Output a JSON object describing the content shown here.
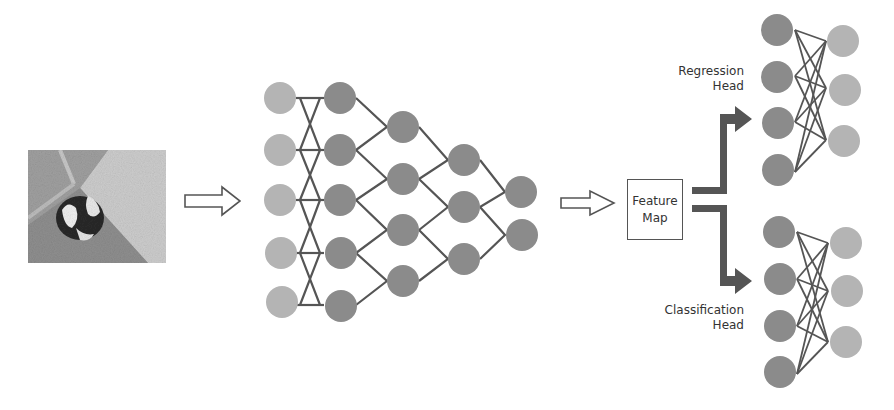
{
  "diagram": {
    "title": "",
    "input_image": {
      "description": "grayscale photo of a black-and-white dog/cat lying on floor near wall corner"
    },
    "stages": [
      {
        "id": "input",
        "label": ""
      },
      {
        "id": "backbone",
        "label": ""
      },
      {
        "id": "feature_map",
        "label": "Feature Map"
      },
      {
        "id": "regression_head",
        "label": "Regression Head"
      },
      {
        "id": "classification_head",
        "label": "Classification Head"
      }
    ],
    "feature_map": {
      "line1": "Feature",
      "line2": "Map"
    },
    "regression_head": {
      "line1": "Regression",
      "line2": "Head"
    },
    "classification_head": {
      "line1": "Classification",
      "line2": "Head"
    },
    "backbone_layers": [
      5,
      5,
      4,
      3,
      2
    ],
    "regression_layers": [
      4,
      3
    ],
    "classification_layers": [
      4,
      3
    ],
    "colors": {
      "light_node": "#b4b4b4",
      "dark_node": "#8b8b8b",
      "line": "#555555",
      "arrow_fill": "#555555",
      "background": "#ffffff"
    }
  }
}
